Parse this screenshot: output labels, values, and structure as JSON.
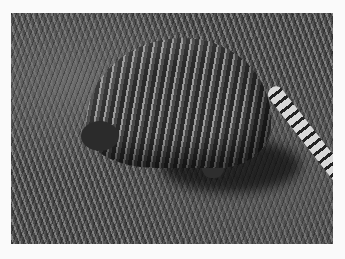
{
  "image": {
    "subject": "nine-banded armadillo foraging in grass",
    "style": "grayscale photograph",
    "colors": {
      "background": "#fafafa",
      "grass_dark": "#3a3a3a",
      "grass_light": "#7a7a7a",
      "shell_dark": "#2a2a2a",
      "shell_light": "#9a9a9a"
    }
  }
}
